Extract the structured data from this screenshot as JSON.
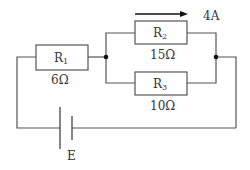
{
  "diagram": {
    "type": "electric-circuit",
    "resistors": [
      {
        "id": "R1",
        "name": "R",
        "sub": "1",
        "value": "6Ω"
      },
      {
        "id": "R2",
        "name": "R",
        "sub": "2",
        "value": "15Ω"
      },
      {
        "id": "R3",
        "name": "R",
        "sub": "3",
        "value": "10Ω"
      }
    ],
    "current": {
      "label": "4A",
      "through": "R2",
      "direction": "right"
    },
    "battery": {
      "label": "E"
    },
    "colors": {
      "wire": "#555555",
      "text": "#333333",
      "background": "#ffffff"
    }
  }
}
